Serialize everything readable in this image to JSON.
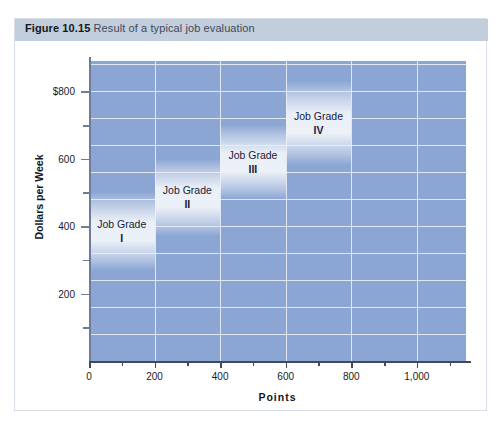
{
  "figure": {
    "number": "Figure 10.15",
    "caption": "Result of a typical job evaluation"
  },
  "colors": {
    "header_bar": "#c3cedd",
    "plot_background": "#8ca6d4",
    "gridline": "#eef2f8",
    "band_highlight": "#eef2f8",
    "text_dark": "#16203c",
    "axis": "#3f4a5a"
  },
  "chart_data": {
    "type": "bar",
    "title": "Result of a typical job evaluation",
    "xlabel": "Points",
    "ylabel": "Dollars per Week",
    "xlim": [
      0,
      1150
    ],
    "ylim": [
      0,
      890
    ],
    "grid": true,
    "legend": "none",
    "x_ticks_major": [
      {
        "value": 0,
        "label": "0"
      },
      {
        "value": 200,
        "label": "200"
      },
      {
        "value": 400,
        "label": "400"
      },
      {
        "value": 600,
        "label": "600"
      },
      {
        "value": 800,
        "label": "800"
      },
      {
        "value": 1000,
        "label": "1,000"
      }
    ],
    "x_ticks_minor": [
      100,
      300,
      500,
      700,
      900,
      1100
    ],
    "y_ticks_major": [
      {
        "value": 200,
        "label": "200"
      },
      {
        "value": 400,
        "label": "400"
      },
      {
        "value": 600,
        "label": "600"
      },
      {
        "value": 800,
        "label": "$800"
      }
    ],
    "y_ticks_minor": [
      100,
      300,
      500,
      700
    ],
    "bars": [
      {
        "label": "Job Grade",
        "roman": "I",
        "x_start": 0,
        "x_end": 200,
        "y_low": 270,
        "y_high": 500
      },
      {
        "label": "Job Grade",
        "roman": "II",
        "x_start": 200,
        "x_end": 400,
        "y_low": 370,
        "y_high": 600
      },
      {
        "label": "Job Grade",
        "roman": "III",
        "x_start": 400,
        "x_end": 600,
        "y_low": 480,
        "y_high": 700
      },
      {
        "label": "Job Grade",
        "roman": "IV",
        "x_start": 600,
        "x_end": 800,
        "y_low": 580,
        "y_high": 830
      }
    ]
  }
}
